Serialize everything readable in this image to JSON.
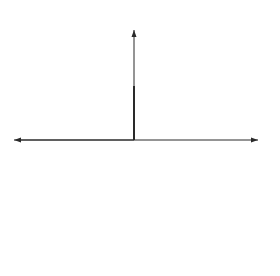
{
  "diagram": {
    "axes": {
      "x_label": "x",
      "y_label": "y"
    },
    "callouts": {
      "orbit": "Orbit",
      "sun": "Sun"
    },
    "points": {
      "neg_a": "− a",
      "neg_c": "− c",
      "c": "c",
      "a": "a"
    },
    "dimensions": {
      "a_plus_c": "a + c",
      "a_minus_c": "a − c"
    },
    "colors": {
      "stroke": "#2a2a2a",
      "ellipse": "#333333"
    }
  }
}
